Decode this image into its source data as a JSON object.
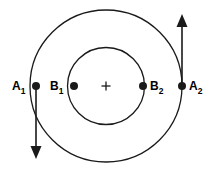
{
  "figure": {
    "type": "concentric-orbit-diagram",
    "background_color": "#ffffff",
    "stroke_color": "#1a1a1a",
    "width": 218,
    "height": 175
  },
  "center_marker": {
    "name": "center-cross",
    "glyph": "+",
    "x": 106,
    "y": 86
  },
  "circles": [
    {
      "name": "outer-orbit",
      "cx": 106,
      "cy": 86,
      "r": 76,
      "stroke_width": 1.3
    },
    {
      "name": "inner-orbit",
      "cx": 106,
      "cy": 86,
      "r": 38.5,
      "stroke_width": 1.3
    }
  ],
  "points": [
    {
      "id": "A1",
      "label": "A",
      "subscript": "1",
      "cx": 36,
      "cy": 86,
      "r": 4,
      "label_x": 12,
      "label_y": 90,
      "label_side": "left"
    },
    {
      "id": "B1",
      "label": "B",
      "subscript": "1",
      "cx": 74,
      "cy": 86,
      "r": 4,
      "label_x": 50,
      "label_y": 90,
      "label_side": "left"
    },
    {
      "id": "B2",
      "label": "B",
      "subscript": "2",
      "cx": 143,
      "cy": 86,
      "r": 4,
      "label_x": 150,
      "label_y": 90,
      "label_side": "right"
    },
    {
      "id": "A2",
      "label": "A",
      "subscript": "2",
      "cx": 182,
      "cy": 86,
      "r": 4,
      "label_x": 189,
      "label_y": 90,
      "label_side": "right"
    }
  ],
  "arrows": [
    {
      "id": "arrow-A1-down",
      "name": "velocity-arrow-down",
      "direction": "down",
      "x": 36,
      "y_start": 88,
      "y_end": 159,
      "head_width": 11,
      "head_length": 13
    },
    {
      "id": "arrow-A2-up",
      "name": "velocity-arrow-up",
      "direction": "up",
      "x": 182,
      "y_start": 84,
      "y_end": 14,
      "head_width": 11,
      "head_length": 13
    }
  ]
}
